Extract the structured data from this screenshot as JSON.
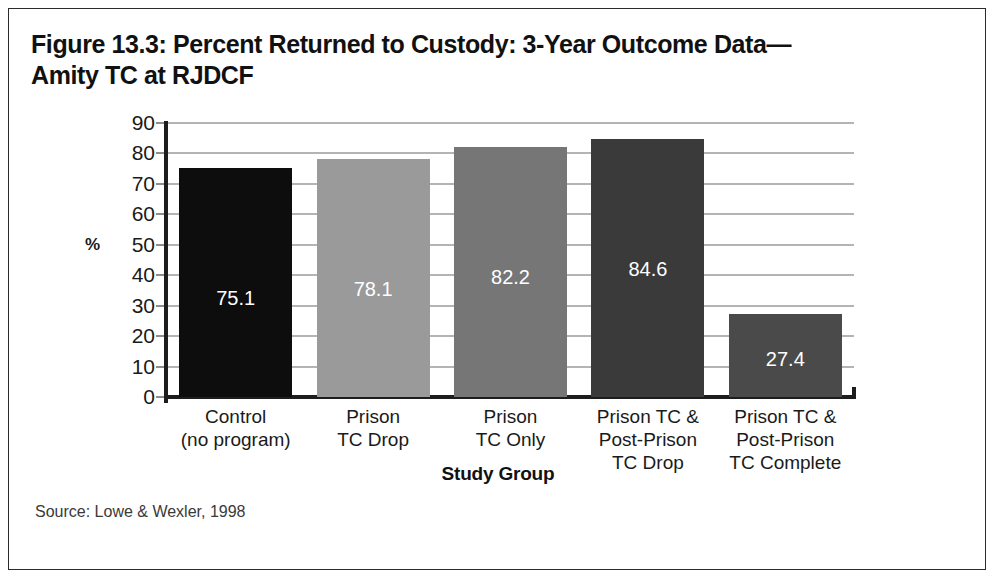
{
  "figure": {
    "title": "Figure 13.3: Percent Returned to Custody: 3-Year Outcome Data—\nAmity TC at RJDCF",
    "source": "Source: Lowe & Wexler, 1998"
  },
  "chart_data": {
    "type": "bar",
    "xlabel": "Study Group",
    "ylabel": "%",
    "ylim": [
      0,
      90
    ],
    "yticks": [
      0,
      10,
      20,
      30,
      40,
      50,
      60,
      70,
      80,
      90
    ],
    "ytick_labels": [
      "0",
      "10",
      "20",
      "30",
      "40",
      "50",
      "60",
      "70",
      "80",
      "90"
    ],
    "grid": true,
    "legend": "none",
    "categories": [
      "Control\n(no program)",
      "Prison\nTC Drop",
      "Prison\nTC Only",
      "Prison TC &\nPost-Prison\nTC Drop",
      "Prison TC &\nPost-Prison\nTC Complete"
    ],
    "values": [
      75.1,
      78.1,
      82.2,
      84.6,
      27.4
    ],
    "value_labels": [
      "75.1",
      "78.1",
      "82.2",
      "84.6",
      "27.4"
    ],
    "bar_colors": [
      "#0d0d0d",
      "#9a9a9a",
      "#767676",
      "#3a3a3a",
      "#4a4a4a"
    ],
    "value_label_color": "#ffffff"
  },
  "colors": {
    "background": "#ffffff",
    "frame_border": "#2b2b2b",
    "axis": "#1d1d1d",
    "gridline": "#b4b4b4",
    "text": "#1a1a1a"
  }
}
